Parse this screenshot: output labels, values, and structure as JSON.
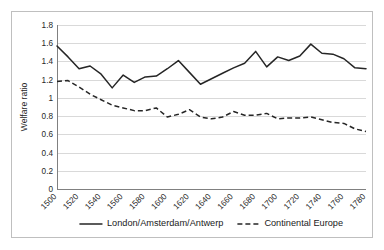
{
  "chart_data": {
    "type": "line",
    "title": "",
    "xlabel": "",
    "ylabel": "Welfare ratio",
    "ylim": [
      0,
      1.8
    ],
    "ytick_values": [
      0,
      0.2,
      0.4,
      0.6,
      0.8,
      1,
      1.2,
      1.4,
      1.6,
      1.8
    ],
    "ytick_labels": [
      "0",
      "0.2",
      "0.4",
      "0.6",
      "0.8",
      "1",
      "1.2",
      "1.4",
      "1.6",
      "1.8"
    ],
    "xlim": [
      1500,
      1780
    ],
    "xtick_values": [
      1500,
      1520,
      1540,
      1560,
      1580,
      1600,
      1620,
      1640,
      1660,
      1680,
      1700,
      1720,
      1740,
      1760,
      1780
    ],
    "xtick_labels": [
      "1500",
      "1520",
      "1540",
      "1560",
      "1580",
      "1600",
      "1620",
      "1640",
      "1660",
      "1680",
      "1700",
      "1720",
      "1740",
      "1760",
      "1780"
    ],
    "grid": "horizontal",
    "legend_position": "bottom",
    "x": [
      1500,
      1510,
      1520,
      1530,
      1540,
      1550,
      1560,
      1570,
      1580,
      1590,
      1600,
      1610,
      1620,
      1630,
      1640,
      1650,
      1660,
      1670,
      1680,
      1690,
      1700,
      1710,
      1720,
      1730,
      1740,
      1750,
      1760,
      1770,
      1780
    ],
    "series": [
      {
        "name": "London/Amsterdam/Antwerp",
        "style": "solid",
        "color": "#262626",
        "values": [
          1.57,
          1.45,
          1.32,
          1.35,
          1.26,
          1.11,
          1.25,
          1.17,
          1.23,
          1.24,
          1.32,
          1.41,
          1.28,
          1.15,
          1.21,
          1.27,
          1.33,
          1.38,
          1.51,
          1.34,
          1.45,
          1.41,
          1.46,
          1.59,
          1.49,
          1.48,
          1.43,
          1.33,
          1.32
        ]
      },
      {
        "name": "Continental Europe",
        "style": "dashed",
        "color": "#262626",
        "values": [
          1.18,
          1.19,
          1.12,
          1.04,
          0.98,
          0.92,
          0.89,
          0.86,
          0.86,
          0.89,
          0.79,
          0.82,
          0.87,
          0.79,
          0.77,
          0.79,
          0.85,
          0.81,
          0.81,
          0.83,
          0.77,
          0.78,
          0.78,
          0.79,
          0.76,
          0.73,
          0.72,
          0.66,
          0.63
        ]
      }
    ]
  },
  "legend": {
    "items": [
      {
        "label": "London/Amsterdam/Antwerp",
        "style": "solid"
      },
      {
        "label": "Continental Europe",
        "style": "dashed"
      }
    ]
  }
}
